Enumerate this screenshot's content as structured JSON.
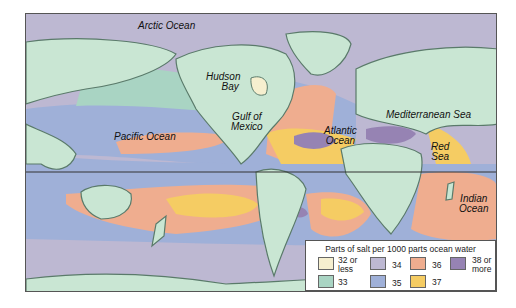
{
  "map": {
    "title": "Ocean salinity world map",
    "labels": {
      "arctic": "Arctic Ocean",
      "hudson": "Hudson\nBay",
      "hudson_1": "Hudson",
      "hudson_2": "Bay",
      "gulf_1": "Gulf of",
      "gulf_2": "Mexico",
      "pacific": "Pacific Ocean",
      "atlantic_1": "Atlantic",
      "atlantic_2": "Ocean",
      "med": "Mediterranean Sea",
      "red_1": "Red",
      "red_2": "Sea",
      "indian_1": "Indian",
      "indian_2": "Ocean"
    },
    "colors": {
      "land": "#c9e6d3",
      "coast": "#5a7a6a",
      "s32": "#f6efcf",
      "s33": "#a9d4c3",
      "s34": "#bdb8d2",
      "s35": "#9fb0d8",
      "s36": "#efad8f",
      "s37": "#f5cc63",
      "s38": "#9683b3"
    }
  },
  "legend": {
    "title": "Parts of salt per 1000 parts ocean water",
    "items": [
      {
        "label_1": "32 or",
        "label_2": "less",
        "color": "#f6efcf"
      },
      {
        "label_1": "33",
        "label_2": "",
        "color": "#a9d4c3"
      },
      {
        "label_1": "34",
        "label_2": "",
        "color": "#bdb8d2"
      },
      {
        "label_1": "35",
        "label_2": "",
        "color": "#9fb0d8"
      },
      {
        "label_1": "36",
        "label_2": "",
        "color": "#efad8f"
      },
      {
        "label_1": "37",
        "label_2": "",
        "color": "#f5cc63"
      },
      {
        "label_1": "38 or",
        "label_2": "more",
        "color": "#9683b3"
      }
    ]
  }
}
